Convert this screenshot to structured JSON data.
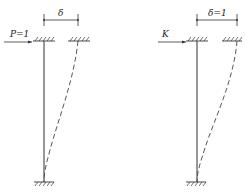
{
  "diagram": {
    "left_panel": {
      "load_label": "P=1",
      "displacement_label": "δ",
      "description": "Cantilever column fixed at base with unit horizontal load P=1 at top producing lateral displacement δ"
    },
    "right_panel": {
      "load_label": "K",
      "displacement_label": "δ=1",
      "description": "Cantilever column fixed at base with force K at top producing unit lateral displacement δ=1"
    },
    "colors": {
      "line": "#333333",
      "background": "#ffffff"
    }
  }
}
